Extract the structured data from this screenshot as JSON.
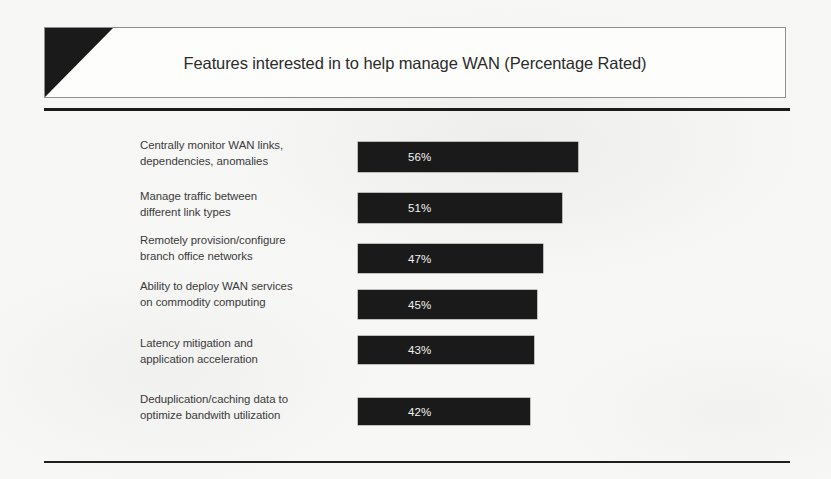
{
  "header": {
    "title": "Features interested in to help manage WAN (Percentage Rated)",
    "wedge_color": "#1a1a1a",
    "border_color": "#8e8e8e"
  },
  "page": {
    "background_color": "#f7f7f6",
    "rule_color": "#1c1c1c"
  },
  "chart_data": {
    "type": "bar",
    "orientation": "horizontal",
    "title": "Features interested in to help manage WAN (Percentage Rated)",
    "xlabel": "",
    "ylabel": "",
    "xlim": [
      0,
      100
    ],
    "grid": false,
    "legend": null,
    "value_suffix": "%",
    "bar_color": "#1a1a1a",
    "value_label_color": "#f2f2f0",
    "categories": [
      "Centrally monitor WAN links, dependencies, anomalies",
      "Manage traffic between different link types",
      "Remotely provision/configure branch office networks",
      "Ability to deploy WAN services on commodity computing",
      "Latency mitigation and application acceleration",
      "Deduplication/caching data to optimize bandwith utilization"
    ],
    "values": [
      56,
      51,
      47,
      45,
      43,
      42
    ],
    "value_labels": [
      "56%",
      "51%",
      "47%",
      "45%",
      "43%",
      "42%"
    ]
  },
  "rows": [
    {
      "label_line1": "Centrally monitor WAN links,",
      "label_line2": "dependencies, anomalies",
      "value_label": "56%",
      "value": 56
    },
    {
      "label_line1": "Manage traffic between",
      "label_line2": "different link types",
      "value_label": "51%",
      "value": 51
    },
    {
      "label_line1": "Remotely provision/configure",
      "label_line2": "branch office networks",
      "value_label": "47%",
      "value": 47
    },
    {
      "label_line1": "Ability to deploy WAN services",
      "label_line2": "on commodity computing",
      "value_label": "45%",
      "value": 45
    },
    {
      "label_line1": "Latency mitigation and",
      "label_line2": "application acceleration",
      "value_label": "43%",
      "value": 43
    },
    {
      "label_line1": "Deduplication/caching data to",
      "label_line2": "optimize bandwith utilization",
      "value_label": "42%",
      "value": 42
    }
  ]
}
